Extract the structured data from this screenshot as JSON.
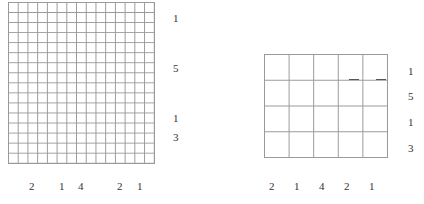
{
  "left_puzzle": {
    "columns": 15,
    "rows": 16,
    "row_clues": [
      "1",
      "5",
      "1",
      "3"
    ],
    "column_clues": [
      "2",
      "1",
      "4",
      "2",
      "1"
    ]
  },
  "right_puzzle": {
    "columns": 5,
    "rows": 4,
    "row_clues": [
      "1",
      "5",
      "1",
      "3"
    ],
    "column_clues": [
      "2",
      "1",
      "4",
      "2",
      "1"
    ]
  }
}
